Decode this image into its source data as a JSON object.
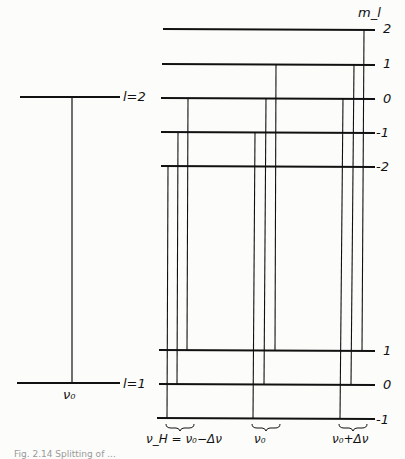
{
  "diagram": {
    "header_label": "m_l",
    "left": {
      "upper_label": "l=2",
      "lower_label": "l=1",
      "transition_label": "ν₀"
    },
    "upper_levels": [
      "2",
      "1",
      "0",
      "-1",
      "-2"
    ],
    "lower_levels": [
      "1",
      "0",
      "-1"
    ],
    "groups": [
      {
        "label": "ν_H = ν₀−Δν"
      },
      {
        "label": "ν₀"
      },
      {
        "label": "ν₀+Δν"
      }
    ],
    "caption": "Fig. 2.14  Splitting of ..."
  }
}
